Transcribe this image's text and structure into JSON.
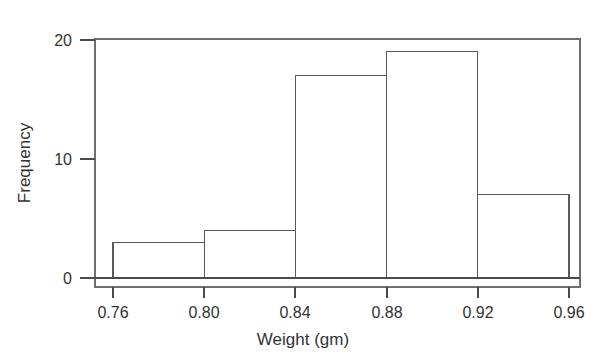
{
  "figure": {
    "title_remnant": "Histogram of Weight",
    "background_color": "#ffffff",
    "line_color": "#5a5a5a",
    "text_color": "#333333",
    "bar_fill_color": "#ffffff"
  },
  "chart_data": {
    "type": "bar",
    "title": "",
    "xlabel": "Weight (gm)",
    "ylabel": "Frequency",
    "categories": [
      "0.76-0.80",
      "0.80-0.84",
      "0.84-0.88",
      "0.88-0.92",
      "0.92-0.96"
    ],
    "bin_edges": [
      0.76,
      0.8,
      0.84,
      0.88,
      0.92,
      0.96
    ],
    "values": [
      3,
      4,
      17,
      19,
      7
    ],
    "x_tick_labels": [
      "0.76",
      "0.80",
      "0.84",
      "0.88",
      "0.92",
      "0.96"
    ],
    "x_tick_values": [
      0.76,
      0.8,
      0.84,
      0.88,
      0.92,
      0.96
    ],
    "y_tick_labels": [
      "0",
      "10",
      "20"
    ],
    "y_tick_values": [
      0,
      10,
      20
    ],
    "xlim": [
      0.76,
      0.96
    ],
    "ylim": [
      0,
      20
    ],
    "grid": false,
    "legend": false,
    "bin_width": 0.04,
    "total_count": 50
  },
  "axes": {
    "y_labels": [
      "20",
      "10",
      "0"
    ],
    "x_labels": [
      "0.76",
      "0.80",
      "0.84",
      "0.88",
      "0.92",
      "0.96"
    ],
    "x_title": "Weight (gm)",
    "y_title": "Frequency"
  }
}
